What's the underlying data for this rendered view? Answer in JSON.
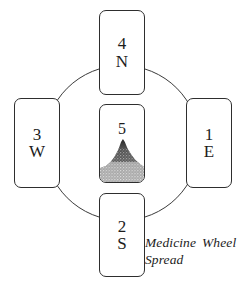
{
  "figure": {
    "title": "Medicine Wheel Spread",
    "caption_lines": [
      "Medicine Wheel",
      "Spread"
    ]
  },
  "wheel": {
    "ring_color": "#3a3a3a",
    "card_border_color": "#2e2e2e",
    "card_background": "#ffffff",
    "text_color": "#1c1c1c"
  },
  "cards": [
    {
      "id": "east",
      "number": "1",
      "direction": "E",
      "position": "right"
    },
    {
      "id": "south",
      "number": "2",
      "direction": "S",
      "position": "bottom"
    },
    {
      "id": "west",
      "number": "3",
      "direction": "W",
      "position": "left"
    },
    {
      "id": "north",
      "number": "4",
      "direction": "N",
      "position": "top"
    },
    {
      "id": "center",
      "number": "5",
      "direction": "",
      "position": "center"
    }
  ],
  "center_card": {
    "number": "5",
    "artwork": "stippled-mountain",
    "artwork_peak_color": "#1a1a1a",
    "artwork_base_color": "#d8d8d8"
  }
}
